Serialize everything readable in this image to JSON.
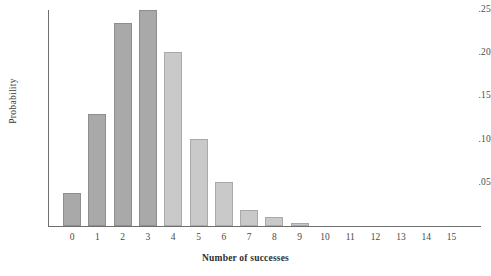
{
  "chart_data": {
    "type": "bar",
    "title": "",
    "subtitle": "",
    "xlabel": "Number of successes",
    "ylabel": "Probability",
    "categories": [
      "0",
      "1",
      "2",
      "3",
      "4",
      "5",
      "6",
      "7",
      "8",
      "9",
      "10",
      "11",
      "12",
      "13",
      "14",
      "15"
    ],
    "values": [
      0.038,
      0.13,
      0.235,
      0.25,
      0.201,
      0.101,
      0.051,
      0.019,
      0.01,
      0.004,
      0.0,
      0.0,
      0.0,
      0.0,
      0.0,
      0.0
    ],
    "ylim": [
      0,
      0.25
    ],
    "xlim": [
      -0.6,
      15.6
    ],
    "ytick_labels": [
      ".05",
      ".10",
      ".15",
      ".20",
      ".25"
    ],
    "ytick_values": [
      0.05,
      0.1,
      0.15,
      0.2,
      0.25
    ],
    "grid": false,
    "legend": "none",
    "series": [
      {
        "name": "Probability",
        "values": [
          0.038,
          0.13,
          0.235,
          0.25,
          0.201,
          0.101,
          0.051,
          0.019,
          0.01,
          0.004,
          0.0,
          0.0,
          0.0,
          0.0,
          0.0,
          0.0
        ]
      }
    ],
    "bar_shades": [
      "dark",
      "dark",
      "dark",
      "dark",
      "light",
      "light",
      "light",
      "light",
      "light",
      "light",
      "light",
      "light",
      "light",
      "light",
      "light",
      "light"
    ],
    "colors": {
      "bar_dark": "#a9a9a9",
      "bar_light": "#c9c9c9",
      "bar_dark_edge": "#8e8e8e",
      "bar_light_edge": "#a9a9a9",
      "axis": "#6f6f6f",
      "text": "#4a4a4a",
      "background": "#ffffff"
    }
  }
}
